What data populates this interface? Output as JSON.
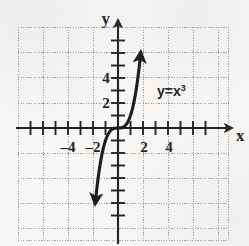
{
  "figure": {
    "background_color": "#f7f6f4",
    "ink_color": "#232323",
    "grid_color": "#9a9a9a",
    "axis_label_x": "x",
    "axis_label_y": "y",
    "curve_label_base": "y=x",
    "curve_label_exponent": "3"
  },
  "chart_data": {
    "type": "line",
    "title": "",
    "subtitle": "",
    "xlabel": "x",
    "ylabel": "y",
    "annotations": [
      "y=x^3"
    ],
    "legend": [
      "y=x^3"
    ],
    "legend_position": "inline-right-of-curve",
    "grid": true,
    "grid_style": "dotted",
    "grid_spacing_x": 2,
    "grid_spacing_y": 2,
    "tick_spacing_x": 1,
    "tick_spacing_y": 1,
    "xlim": [
      -5,
      5
    ],
    "ylim": [
      -6,
      6
    ],
    "xticks": [
      -5,
      -4,
      -3,
      -2,
      -1,
      0,
      1,
      2,
      3,
      4,
      5
    ],
    "yticks": [
      -6,
      -5,
      -4,
      -3,
      -2,
      -1,
      0,
      1,
      2,
      3,
      4,
      5,
      6
    ],
    "xtick_labels_shown": [
      {
        "value": -4,
        "label": "4",
        "prefix": "–"
      },
      {
        "value": -2,
        "label": "2",
        "prefix": "–"
      },
      {
        "value": 2,
        "label": "2",
        "prefix": ""
      },
      {
        "value": 4,
        "label": "4",
        "prefix": ""
      }
    ],
    "ytick_labels_shown": [
      {
        "value": 4,
        "label": "4"
      },
      {
        "value": 2,
        "label": "2"
      }
    ],
    "series": [
      {
        "name": "y=x^3",
        "equation": "y = x^3",
        "arrow_start": true,
        "arrow_end": true,
        "x": [
          -1.82,
          -1.7,
          -1.55,
          -1.4,
          -1.25,
          -1.1,
          -0.95,
          -0.8,
          -0.65,
          -0.5,
          -0.35,
          -0.2,
          0.0,
          0.2,
          0.35,
          0.5,
          0.65,
          0.8,
          0.95,
          1.1,
          1.25,
          1.4,
          1.55,
          1.7,
          1.82
        ],
        "y": [
          -6.03,
          -4.91,
          -3.72,
          -2.74,
          -1.95,
          -1.33,
          -0.86,
          -0.51,
          -0.27,
          -0.13,
          -0.04,
          -0.01,
          0.0,
          0.01,
          0.04,
          0.13,
          0.27,
          0.51,
          0.86,
          1.33,
          1.95,
          2.74,
          3.72,
          4.91,
          6.03
        ]
      }
    ]
  }
}
